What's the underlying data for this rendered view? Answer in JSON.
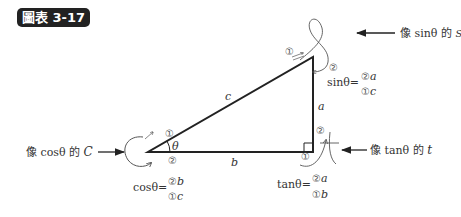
{
  "figure": {
    "badge": "圖表 3-17"
  },
  "triangle": {
    "side_hypotenuse": "c",
    "side_opposite": "a",
    "side_adjacent": "b",
    "angle": "θ"
  },
  "annotations": {
    "sin": {
      "caption_prefix": "像 ",
      "caption_fn": "sinθ",
      "caption_suffix": " 的 ",
      "glyph": "ꟸ",
      "glyph_label": "S",
      "formula_lhs": "sinθ=",
      "numerator_mark": "②",
      "numerator_var": "a",
      "denominator_mark": "①",
      "denominator_var": "c",
      "mark1": "①",
      "mark2": "②"
    },
    "cos": {
      "caption_prefix": "像 ",
      "caption_fn": "cosθ",
      "caption_suffix": " 的 ",
      "glyph_label": "C",
      "formula_lhs": "cosθ=",
      "numerator_mark": "②",
      "numerator_var": "b",
      "denominator_mark": "①",
      "denominator_var": "c",
      "mark1": "①",
      "mark2": "②"
    },
    "tan": {
      "caption_prefix": "像 ",
      "caption_fn": "tanθ",
      "caption_suffix": " 的 ",
      "glyph_label": "t",
      "formula_lhs": "tanθ=",
      "numerator_mark": "②",
      "numerator_var": "a",
      "denominator_mark": "①",
      "denominator_var": "b",
      "mark1": "①",
      "mark2": "②"
    }
  }
}
